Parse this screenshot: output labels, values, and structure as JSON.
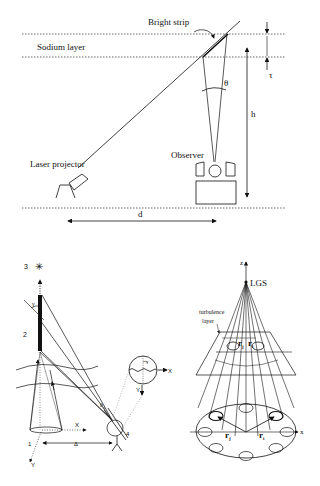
{
  "figure_top": {
    "labels": {
      "bright_strip": "Bright strip",
      "sodium_layer": "Sodium layer",
      "theta": "θ",
      "tau": "τ",
      "h": "h",
      "laser_projector": "Laser projector",
      "observer": "Observer",
      "d": "d"
    }
  },
  "figure_bottom_left": {
    "labels": {
      "n1": "1",
      "n2": "2",
      "n3": "3",
      "n4": "4",
      "gamma": "γ",
      "gamma_inset": "γ",
      "theta_n": "θ",
      "theta_n_sub": "n",
      "x": "X",
      "y": "Y",
      "delta": "Δ",
      "inset_x": "X",
      "inset_y": "Y",
      "star": "✳"
    }
  },
  "figure_bottom_right": {
    "labels": {
      "z": "z",
      "lgs": "LGS",
      "turbulence": "turbulence",
      "layer": "layer",
      "x": "x",
      "rj_top": "r",
      "rj_top_sub": "j",
      "ri_top": "r",
      "ri_top_sub": "i",
      "rj": "r",
      "rj_sub": "j",
      "ri": "r",
      "ri_sub": "i"
    }
  }
}
